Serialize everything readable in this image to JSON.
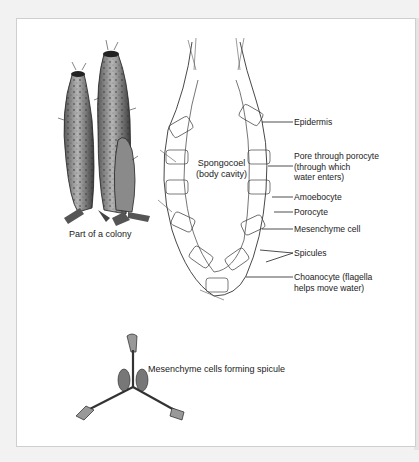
{
  "figure": {
    "colony_caption": "Part of a colony",
    "cavity_label": {
      "line1": "Spongocoel",
      "line2": "(body cavity)"
    },
    "labels": [
      {
        "id": "epidermis",
        "lines": [
          "Epidermis"
        ]
      },
      {
        "id": "pore",
        "lines": [
          "Pore through porocyte",
          "(through which",
          "water enters)"
        ]
      },
      {
        "id": "amoebocyte",
        "lines": [
          "Amoebocyte"
        ]
      },
      {
        "id": "porocyte",
        "lines": [
          "Porocyte"
        ]
      },
      {
        "id": "mesenchyme",
        "lines": [
          "Mesenchyme cell"
        ]
      },
      {
        "id": "spicules",
        "lines": [
          "Spicules"
        ]
      },
      {
        "id": "choanocyte",
        "lines": [
          "Choanocyte (flagella",
          "helps move water)"
        ]
      }
    ],
    "spicule_caption": "Mesenchyme cells forming spicule"
  }
}
